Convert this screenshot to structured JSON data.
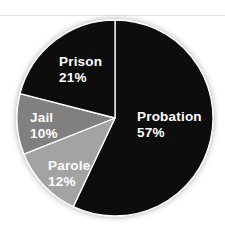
{
  "chart_data": {
    "type": "pie",
    "title": "",
    "categories": [
      "Probation",
      "Parole",
      "Jail",
      "Prison"
    ],
    "values": [
      57,
      12,
      10,
      21
    ],
    "unit": "%",
    "start_angle_deg": 0,
    "direction": "clockwise",
    "colors": [
      "#0d0d0d",
      "#a3a3a3",
      "#808080",
      "#0d0d0d"
    ],
    "labels": [
      {
        "name": "Probation",
        "pct": "57%"
      },
      {
        "name": "Parole",
        "pct": "12%"
      },
      {
        "name": "Jail",
        "pct": "10%"
      },
      {
        "name": "Prison",
        "pct": "21%"
      }
    ],
    "legend": "none (labels inside slices)"
  }
}
